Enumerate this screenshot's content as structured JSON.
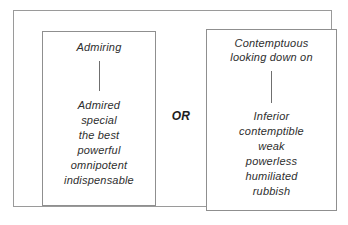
{
  "diagram": {
    "connector_label": "OR",
    "ink_color": "#2e2e2e",
    "frame_color": "#9a9a9a",
    "background_color": "#ffffff",
    "options": [
      {
        "id": "admiring",
        "heading": "Admiring",
        "words": [
          "Admired",
          "special",
          "the best",
          "powerful",
          "omnipotent",
          "indispensable"
        ]
      },
      {
        "id": "contemptuous",
        "heading": "Contemptuous\nlooking down on",
        "words": [
          "Inferior",
          "contemptible",
          "weak",
          "powerless",
          "humiliated",
          "rubbish"
        ]
      }
    ]
  }
}
